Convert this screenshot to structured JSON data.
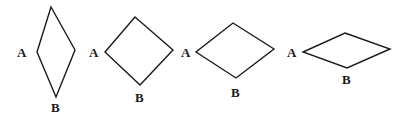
{
  "diagram": {
    "shapes": [
      {
        "id": "rhombus-1",
        "points": [
          [
            51,
            7
          ],
          [
            75,
            50
          ],
          [
            56,
            97
          ],
          [
            37,
            52
          ]
        ],
        "label_a": {
          "text": "A",
          "x": 17,
          "y": 57
        },
        "label_b": {
          "text": "B",
          "x": 51,
          "y": 112
        }
      },
      {
        "id": "rhombus-2",
        "points": [
          [
            135,
            17
          ],
          [
            173,
            50
          ],
          [
            140,
            85
          ],
          [
            105,
            52
          ]
        ],
        "label_a": {
          "text": "A",
          "x": 89,
          "y": 57
        },
        "label_b": {
          "text": "B",
          "x": 135,
          "y": 102
        }
      },
      {
        "id": "rhombus-3",
        "points": [
          [
            233,
            23
          ],
          [
            274,
            49
          ],
          [
            236,
            78
          ],
          [
            196,
            52
          ]
        ],
        "label_a": {
          "text": "A",
          "x": 181,
          "y": 57
        },
        "label_b": {
          "text": "B",
          "x": 231,
          "y": 97
        }
      },
      {
        "id": "rhombus-4",
        "points": [
          [
            345,
            33
          ],
          [
            390,
            49
          ],
          [
            347,
            68
          ],
          [
            303,
            52
          ]
        ],
        "label_a": {
          "text": "A",
          "x": 287,
          "y": 57
        },
        "label_b": {
          "text": "B",
          "x": 342,
          "y": 84
        }
      }
    ]
  }
}
